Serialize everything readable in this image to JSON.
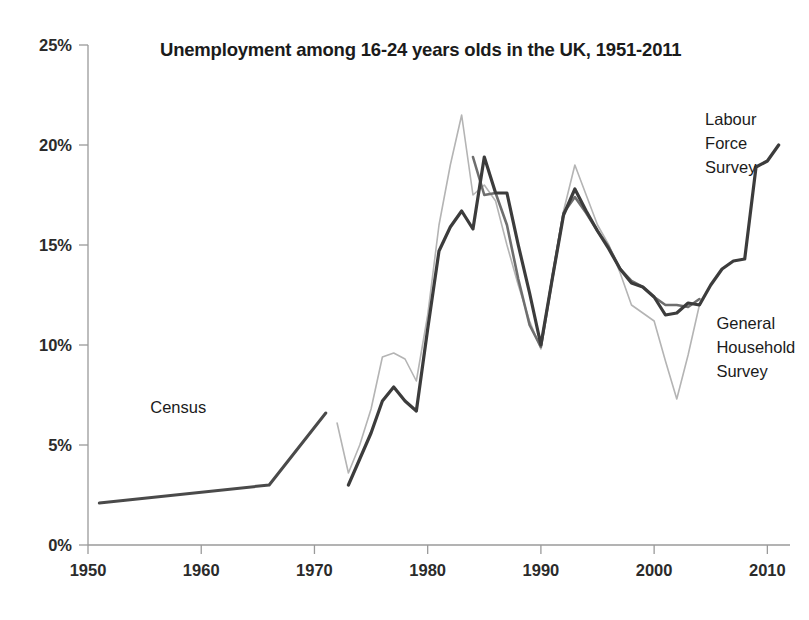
{
  "chart_data": {
    "type": "line",
    "title": "Unemployment among 16-24 years olds in the UK, 1951-2011",
    "xlabel": "",
    "ylabel": "",
    "xlim": [
      1950,
      2012
    ],
    "ylim": [
      0,
      25
    ],
    "grid": false,
    "legend_position": "inline-annotations",
    "y_ticks": [
      "0%",
      "5%",
      "10%",
      "15%",
      "20%",
      "25%"
    ],
    "y_tick_values": [
      0,
      5,
      10,
      15,
      20,
      25
    ],
    "x_ticks": [
      "1950",
      "1960",
      "1970",
      "1980",
      "1990",
      "2000",
      "2010"
    ],
    "x_tick_values": [
      1950,
      1960,
      1970,
      1980,
      1990,
      2000,
      2010
    ],
    "annotations": [
      {
        "id": "census",
        "text": "Census",
        "x": 1955.5,
        "y": 6.6
      },
      {
        "id": "labour-force-survey",
        "lines": [
          "Labour",
          "Force",
          "Survey"
        ],
        "text": "Labour Force Survey",
        "x": 2004.5,
        "y": 21.0
      },
      {
        "id": "general-household-survey",
        "lines": [
          "General",
          "Household",
          "Survey"
        ],
        "text": "General Household Survey",
        "x": 2005.5,
        "y": 10.8
      }
    ],
    "series": [
      {
        "name": "Census",
        "color": "#4a4a4a",
        "width": 3.0,
        "x": [
          1951,
          1966,
          1971
        ],
        "values": [
          2.1,
          3.0,
          6.6
        ]
      },
      {
        "name": "General Household Survey",
        "color": "#b4b4b4",
        "width": 1.6,
        "x": [
          1972,
          1973,
          1974,
          1975,
          1976,
          1977,
          1978,
          1979,
          1980,
          1981,
          1982,
          1983,
          1984,
          1985,
          1986,
          1987,
          1988,
          1989,
          1990,
          1991,
          1992,
          1993,
          1994,
          1995,
          1996,
          1997,
          1998,
          1999,
          2000,
          2001,
          2002,
          2003,
          2004
        ],
        "values": [
          6.1,
          3.6,
          5.0,
          6.8,
          9.4,
          9.6,
          9.3,
          8.2,
          11.5,
          16.0,
          19.0,
          21.5,
          17.5,
          18.0,
          17.2,
          15.0,
          13.0,
          11.2,
          9.8,
          13.5,
          16.7,
          19.0,
          17.5,
          16.0,
          15.0,
          13.6,
          12.0,
          11.6,
          11.2,
          9.2,
          7.3,
          9.5,
          12.0
        ]
      },
      {
        "name": "Labour Force Survey (secondary)",
        "color": "#6e6e6e",
        "width": 2.6,
        "x": [
          1984,
          1985,
          1986,
          1987,
          1988,
          1989,
          1990,
          1991,
          1992,
          1993,
          1994,
          1995,
          1996,
          1997,
          1998,
          1999,
          2000,
          2001,
          2002,
          2003,
          2004
        ],
        "values": [
          19.4,
          17.5,
          17.6,
          16.0,
          13.3,
          11.0,
          9.9,
          13.3,
          16.6,
          17.4,
          16.6,
          15.7,
          14.9,
          13.8,
          13.2,
          12.9,
          12.4,
          12.0,
          12.0,
          11.9,
          12.3
        ]
      },
      {
        "name": "Labour Force Survey",
        "color": "#3c3c3c",
        "width": 3.2,
        "x": [
          1973,
          1974,
          1975,
          1976,
          1977,
          1978,
          1979,
          1980,
          1981,
          1982,
          1983,
          1984,
          1985,
          1986,
          1987,
          1988,
          1989,
          1990,
          1991,
          1992,
          1993,
          1994,
          1995,
          1996,
          1997,
          1998,
          1999,
          2000,
          2001,
          2002,
          2003,
          2004,
          2005,
          2006,
          2007,
          2008,
          2009,
          2010,
          2011
        ],
        "values": [
          3.0,
          4.3,
          5.6,
          7.2,
          7.9,
          7.2,
          6.7,
          10.8,
          14.7,
          15.9,
          16.7,
          15.8,
          19.4,
          17.6,
          17.6,
          15.0,
          12.6,
          10.0,
          13.3,
          16.5,
          17.8,
          16.7,
          15.7,
          14.8,
          13.8,
          13.1,
          12.9,
          12.4,
          11.5,
          11.6,
          12.1,
          12.0,
          13.0,
          13.8,
          14.2,
          14.3,
          18.9,
          19.2,
          20.0
        ]
      }
    ]
  },
  "axes": {
    "plot_left": 88,
    "plot_right": 790,
    "plot_top": 45,
    "plot_bottom": 545
  }
}
